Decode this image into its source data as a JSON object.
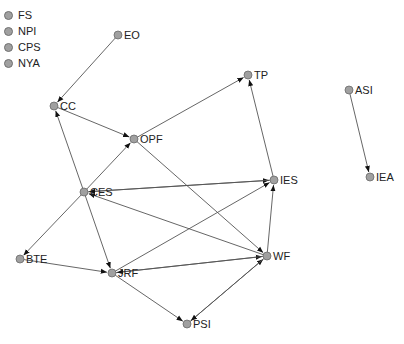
{
  "legend": {
    "items": [
      {
        "label": "FS"
      },
      {
        "label": "NPI"
      },
      {
        "label": "CPS"
      },
      {
        "label": "NYA"
      }
    ]
  },
  "colors": {
    "node_fill": "#a0a0a0",
    "node_stroke": "#6a6a6a",
    "edge": "#555555",
    "arrow": "#111111",
    "label": "#222222"
  },
  "nodes": [
    {
      "id": "EO",
      "label": "EO",
      "x": 118,
      "y": 35
    },
    {
      "id": "CC",
      "label": "CC",
      "x": 54,
      "y": 106
    },
    {
      "id": "OPF",
      "label": "OPF",
      "x": 134,
      "y": 139
    },
    {
      "id": "TP",
      "label": "TP",
      "x": 248,
      "y": 75
    },
    {
      "id": "CES",
      "label": "CES",
      "x": 84,
      "y": 192
    },
    {
      "id": "IES",
      "label": "IES",
      "x": 274,
      "y": 180
    },
    {
      "id": "BTE",
      "label": "BTE",
      "x": 20,
      "y": 259
    },
    {
      "id": "JRF",
      "label": "JRF",
      "x": 112,
      "y": 273
    },
    {
      "id": "WF",
      "label": "WF",
      "x": 267,
      "y": 256
    },
    {
      "id": "PSI",
      "label": "PSI",
      "x": 187,
      "y": 324
    },
    {
      "id": "ASI",
      "label": "ASI",
      "x": 349,
      "y": 90
    },
    {
      "id": "IEA",
      "label": "IEA",
      "x": 370,
      "y": 177
    }
  ],
  "edges": [
    {
      "from": "EO",
      "to": "CC"
    },
    {
      "from": "CC",
      "to": "OPF"
    },
    {
      "from": "CES",
      "to": "CC"
    },
    {
      "from": "CES",
      "to": "OPF"
    },
    {
      "from": "OPF",
      "to": "TP"
    },
    {
      "from": "IES",
      "to": "TP"
    },
    {
      "from": "OPF",
      "to": "WF"
    },
    {
      "from": "CES",
      "to": "IES"
    },
    {
      "from": "IES",
      "to": "CES"
    },
    {
      "from": "WF",
      "to": "CES"
    },
    {
      "from": "CES",
      "to": "BTE"
    },
    {
      "from": "CES",
      "to": "JRF"
    },
    {
      "from": "BTE",
      "to": "JRF"
    },
    {
      "from": "JRF",
      "to": "IES"
    },
    {
      "from": "JRF",
      "to": "WF"
    },
    {
      "from": "WF",
      "to": "JRF"
    },
    {
      "from": "WF",
      "to": "IES"
    },
    {
      "from": "JRF",
      "to": "PSI"
    },
    {
      "from": "PSI",
      "to": "WF"
    },
    {
      "from": "WF",
      "to": "PSI"
    },
    {
      "from": "ASI",
      "to": "IEA"
    }
  ]
}
